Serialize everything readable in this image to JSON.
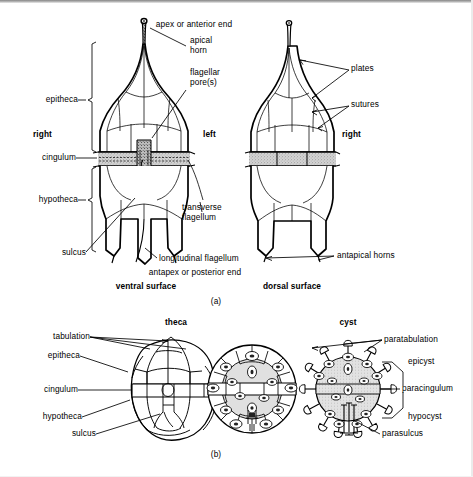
{
  "figure": {
    "panels": [
      {
        "key": "a",
        "caption": "(a)"
      },
      {
        "key": "b",
        "caption": "(b)"
      }
    ]
  },
  "panel_a": {
    "caption": "(a)",
    "top_label": "apex or anterior end",
    "bottom_label": "antapex or posterior end",
    "views": [
      {
        "key": "ventral",
        "title": "ventral surface"
      },
      {
        "key": "dorsal",
        "title": "dorsal surface"
      }
    ],
    "labels": {
      "apical_horn": "apical\nhorn",
      "apical_horn_line1": "apical",
      "apical_horn_line2": "horn",
      "flagellar_pores_line1": "flagellar",
      "flagellar_pores_line2": "pore(s)",
      "epitheca": "epitheca",
      "hypotheca": "hypotheca",
      "cingulum": "cingulum",
      "sulcus": "sulcus",
      "right_ventral": "right",
      "left_ventral": "left",
      "right_dorsal": "right",
      "transverse_flagellum_line1": "transverse",
      "transverse_flagellum_line2": "flagellum",
      "longitudinal_flagellum": "longitudinal flagellum",
      "plates": "plates",
      "sutures": "sutures",
      "antapical_horns": "antapical horns"
    }
  },
  "panel_b": {
    "caption": "(b)",
    "headings": [
      {
        "key": "theca",
        "label": "theca"
      },
      {
        "key": "cyst",
        "label": "cyst"
      }
    ],
    "left_labels": {
      "tabulation": "tabulation",
      "epitheca": "epitheca",
      "cingulum": "cingulum",
      "hypotheca": "hypotheca",
      "sulcus": "sulcus"
    },
    "right_labels": {
      "paratabulation": "paratabulation",
      "epicyst": "epicyst",
      "paracingulum": "paracingulum",
      "hypocyst": "hypocyst",
      "parasulcus": "parasulcus"
    }
  },
  "colors": {
    "ink": "#000000",
    "paper": "#ffffff",
    "cingulum_fill": "#c9c9c9",
    "sulcus_fill": "#b4b4b4",
    "cyst_body_fill": "#d8d8d8",
    "scan_edge": "#8d8d8d"
  }
}
